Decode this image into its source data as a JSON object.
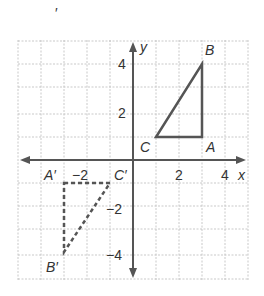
{
  "diagram": {
    "axis_labels": {
      "x": "x",
      "y": "y"
    },
    "x_ticks": [
      {
        "value": -2,
        "label": "−2"
      },
      {
        "value": 2,
        "label": "2"
      },
      {
        "value": 4,
        "label": "4"
      }
    ],
    "y_ticks": [
      {
        "value": 4,
        "label": "4"
      },
      {
        "value": 2,
        "label": "2"
      },
      {
        "value": -2,
        "label": "−2"
      },
      {
        "value": -4,
        "label": "−4"
      }
    ],
    "triangle": {
      "A": [
        3,
        1
      ],
      "B": [
        3,
        4
      ],
      "C": [
        1,
        1
      ],
      "labels": {
        "A": "A",
        "B": "B",
        "C": "C"
      }
    },
    "image": {
      "A": [
        -3,
        -1
      ],
      "B": [
        -3,
        -4
      ],
      "C": [
        -1,
        -1
      ],
      "labels": {
        "A": "A′",
        "B": "B′",
        "C": "C′"
      }
    },
    "grid": {
      "xmin": -5,
      "xmax": 5,
      "ymin": -5,
      "ymax": 5
    },
    "stray_mark": "′"
  }
}
